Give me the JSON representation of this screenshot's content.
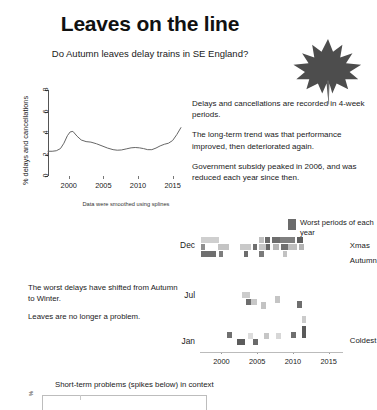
{
  "header": {
    "title": "Leaves on the line",
    "subtitle": "Do Autumn leaves delay trains in SE England?",
    "leaf_icon": "maple-leaf-icon"
  },
  "notes": [
    "Delays and cancellations are recorded in 4-week periods.",
    "The long-term trend was that performance improved, then deteriorated again.",
    "Government subsidy peaked in 2006, and was reduced each year since then."
  ],
  "lower_text": [
    "The worst delays have shifted from Autumn to Winter.",
    "Leaves are no longer a problem."
  ],
  "legend": {
    "swatch_color": "#6b6b6b",
    "label": "Worst periods of each year"
  },
  "bottom": {
    "caption": "Short-term problems (spikes below) in context",
    "ylabel": "%"
  },
  "chart_data": [
    {
      "type": "line",
      "title": "",
      "xlabel": "",
      "ylabel": "% delays and cancellations",
      "caption": "Data were smoothed using splines",
      "xlim": [
        1997,
        2016.5
      ],
      "ylim": [
        0,
        8
      ],
      "xticks": [
        2000,
        2005,
        2010,
        2015
      ],
      "yticks": [
        0,
        2,
        4,
        6,
        8
      ],
      "grid": false,
      "line_color": "#666666",
      "x": [
        1997.0,
        1997.6,
        1998.2,
        1998.8,
        1999.3,
        1999.8,
        2000.2,
        2000.6,
        2001.2,
        2001.8,
        2002.5,
        2003.2,
        2004.0,
        2004.8,
        2005.6,
        2006.4,
        2007.0,
        2007.6,
        2008.3,
        2009.0,
        2009.6,
        2010.2,
        2010.8,
        2011.4,
        2012.0,
        2012.6,
        2013.2,
        2013.8,
        2014.4,
        2015.0,
        2015.6,
        2016.2
      ],
      "values": [
        2.3,
        2.3,
        2.35,
        2.55,
        3.05,
        3.75,
        4.1,
        4.15,
        3.7,
        3.35,
        3.2,
        3.15,
        3.0,
        2.8,
        2.6,
        2.45,
        2.4,
        2.42,
        2.52,
        2.62,
        2.65,
        2.62,
        2.55,
        2.45,
        2.45,
        2.6,
        2.8,
        2.95,
        3.05,
        3.3,
        3.85,
        4.5
      ]
    },
    {
      "type": "heatmap",
      "title": "",
      "ylabel": "",
      "xlabel": "",
      "xlim": [
        1997,
        2017
      ],
      "xticks": [
        2000,
        2005,
        2010,
        2015
      ],
      "yticks": [
        "Dec",
        "Jul",
        "Jan"
      ],
      "ytick_positions": [
        0.94,
        0.5,
        0.1
      ],
      "annotations": [
        {
          "label": "Xmas",
          "x": 1.02,
          "y": 0.93
        },
        {
          "label": "Autumn",
          "x": 1.02,
          "y": 0.8
        },
        {
          "label": "Coldest",
          "x": 1.02,
          "y": 0.1
        }
      ],
      "colors": {
        "light": "#d9d9d9",
        "mid": "#b0b0b0",
        "dark": "#7a7a7a",
        "darkest": "#5e5e5e"
      },
      "cells": [
        {
          "x": 1997.2,
          "y": 0.955,
          "w": 2.4,
          "h": 0.058,
          "c": "#cfcfcf"
        },
        {
          "x": 1997.2,
          "y": 0.893,
          "w": 0.55,
          "h": 0.058,
          "c": "#8f8f8f"
        },
        {
          "x": 1997.2,
          "y": 0.832,
          "w": 2.1,
          "h": 0.058,
          "c": "#6f6f6f"
        },
        {
          "x": 1999.5,
          "y": 0.893,
          "w": 1.5,
          "h": 0.058,
          "c": "#c4c4c4"
        },
        {
          "x": 1999.6,
          "y": 0.832,
          "w": 0.6,
          "h": 0.058,
          "c": "#7d7d7d"
        },
        {
          "x": 2002.6,
          "y": 0.893,
          "w": 1.6,
          "h": 0.058,
          "c": "#c9c9c9"
        },
        {
          "x": 2003.1,
          "y": 0.832,
          "w": 0.6,
          "h": 0.058,
          "c": "#6d6d6d"
        },
        {
          "x": 2004.4,
          "y": 0.893,
          "w": 0.6,
          "h": 0.058,
          "c": "#6f6f6f"
        },
        {
          "x": 2005.3,
          "y": 0.955,
          "w": 0.6,
          "h": 0.058,
          "c": "#c0c0c0"
        },
        {
          "x": 2005.2,
          "y": 0.893,
          "w": 1.1,
          "h": 0.058,
          "c": "#c6c6c6"
        },
        {
          "x": 2005.3,
          "y": 0.832,
          "w": 0.6,
          "h": 0.058,
          "c": "#7a7a7a"
        },
        {
          "x": 2006.1,
          "y": 0.955,
          "w": 0.7,
          "h": 0.058,
          "c": "#6a6a6a"
        },
        {
          "x": 2006.2,
          "y": 0.893,
          "w": 0.6,
          "h": 0.058,
          "c": "#666666"
        },
        {
          "x": 2007.0,
          "y": 0.955,
          "w": 1.2,
          "h": 0.058,
          "c": "#6e6e6e"
        },
        {
          "x": 2007.2,
          "y": 0.893,
          "w": 0.8,
          "h": 0.058,
          "c": "#b7b7b7"
        },
        {
          "x": 2008.2,
          "y": 0.955,
          "w": 2.1,
          "h": 0.058,
          "c": "#7f7f7f"
        },
        {
          "x": 2008.3,
          "y": 0.893,
          "w": 1.0,
          "h": 0.058,
          "c": "#707070"
        },
        {
          "x": 2008.6,
          "y": 0.832,
          "w": 0.6,
          "h": 0.058,
          "c": "#c2c2c2"
        },
        {
          "x": 2009.3,
          "y": 0.893,
          "w": 1.2,
          "h": 0.058,
          "c": "#bfbfbf"
        },
        {
          "x": 2010.5,
          "y": 0.955,
          "w": 0.9,
          "h": 0.058,
          "c": "#5f5f5f"
        },
        {
          "x": 2010.8,
          "y": 0.893,
          "w": 0.8,
          "h": 0.058,
          "c": "#b4b4b4"
        },
        {
          "x": 2002.9,
          "y": 0.47,
          "w": 1.1,
          "h": 0.058,
          "c": "#cccccc"
        },
        {
          "x": 2003.4,
          "y": 0.41,
          "w": 0.7,
          "h": 0.058,
          "c": "#6d6d6d"
        },
        {
          "x": 2004.1,
          "y": 0.41,
          "w": 0.9,
          "h": 0.058,
          "c": "#c7c7c7"
        },
        {
          "x": 2005.5,
          "y": 0.38,
          "w": 0.7,
          "h": 0.058,
          "c": "#c3c3c3"
        },
        {
          "x": 2007.5,
          "y": 0.43,
          "w": 0.7,
          "h": 0.058,
          "c": "#c5c5c5"
        },
        {
          "x": 2010.6,
          "y": 0.39,
          "w": 0.7,
          "h": 0.058,
          "c": "#6e6e6e"
        },
        {
          "x": 2000.8,
          "y": 0.12,
          "w": 0.7,
          "h": 0.058,
          "c": "#707070"
        },
        {
          "x": 2002.2,
          "y": 0.06,
          "w": 1.1,
          "h": 0.058,
          "c": "#5c5c5c"
        },
        {
          "x": 2003.7,
          "y": 0.11,
          "w": 0.7,
          "h": 0.058,
          "c": "#dcdcdc"
        },
        {
          "x": 2004.4,
          "y": 0.06,
          "w": 0.7,
          "h": 0.058,
          "c": "#6a6a6a"
        },
        {
          "x": 2006.0,
          "y": 0.11,
          "w": 0.7,
          "h": 0.058,
          "c": "#c6c6c6"
        },
        {
          "x": 2007.6,
          "y": 0.11,
          "w": 0.7,
          "h": 0.058,
          "c": "#d7d7d7"
        },
        {
          "x": 2009.7,
          "y": 0.12,
          "w": 0.7,
          "h": 0.058,
          "c": "#6f6f6f"
        },
        {
          "x": 2011.3,
          "y": 0.12,
          "w": 0.55,
          "h": 0.11,
          "c": "#5a5a5a"
        },
        {
          "x": 2011.3,
          "y": 0.25,
          "w": 0.55,
          "h": 0.07,
          "c": "#cbcbcb"
        }
      ]
    }
  ]
}
